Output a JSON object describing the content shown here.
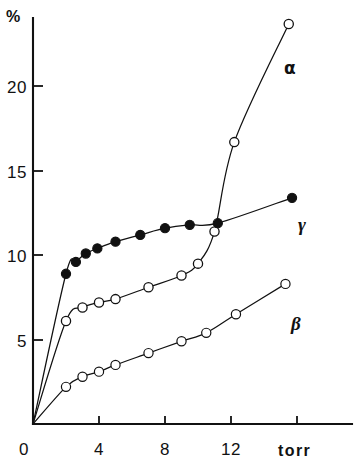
{
  "chart_data": {
    "type": "scatter",
    "title": "",
    "subtitle": "",
    "xlabel": "torr",
    "ylabel": "%",
    "xlim": [
      0,
      17.5
    ],
    "ylim": [
      0,
      25.5
    ],
    "xticks": [
      0,
      4,
      8,
      12,
      16
    ],
    "xtick_labels": [
      "0",
      "4",
      "8",
      "12",
      ""
    ],
    "yticks": [
      0,
      5,
      10,
      15,
      20
    ],
    "ytick_labels": [
      "0",
      "5",
      "10",
      "15",
      "20"
    ],
    "grid": false,
    "legend_position": "inline-annotations",
    "annotations": [
      {
        "text": "α",
        "x": 13.2,
        "y": 21.0,
        "series": "alpha"
      },
      {
        "text": "γ",
        "x": 16.2,
        "y": 11.8,
        "series": "gamma"
      },
      {
        "text": "β",
        "x": 15.7,
        "y": 6.0,
        "series": "beta"
      }
    ],
    "series": [
      {
        "name": "α",
        "label": "alpha",
        "marker": "open-circle",
        "points": [
          {
            "x": 0.0,
            "y": 0.0
          },
          {
            "x": 2.0,
            "y": 6.1
          },
          {
            "x": 3.0,
            "y": 6.9
          },
          {
            "x": 4.0,
            "y": 7.2
          },
          {
            "x": 5.0,
            "y": 7.4
          },
          {
            "x": 7.0,
            "y": 8.1
          },
          {
            "x": 9.0,
            "y": 8.8
          },
          {
            "x": 10.0,
            "y": 9.5
          },
          {
            "x": 11.0,
            "y": 11.4
          },
          {
            "x": 12.2,
            "y": 16.7
          },
          {
            "x": 15.5,
            "y": 23.7
          }
        ]
      },
      {
        "name": "γ",
        "label": "gamma",
        "marker": "filled-circle",
        "points": [
          {
            "x": 0.0,
            "y": 0.0
          },
          {
            "x": 2.0,
            "y": 8.9
          },
          {
            "x": 2.6,
            "y": 9.6
          },
          {
            "x": 3.2,
            "y": 10.1
          },
          {
            "x": 3.9,
            "y": 10.4
          },
          {
            "x": 5.0,
            "y": 10.8
          },
          {
            "x": 6.5,
            "y": 11.2
          },
          {
            "x": 8.0,
            "y": 11.6
          },
          {
            "x": 9.5,
            "y": 11.8
          },
          {
            "x": 11.2,
            "y": 11.9
          },
          {
            "x": 15.7,
            "y": 13.4
          }
        ]
      },
      {
        "name": "β",
        "label": "beta",
        "marker": "half-filled-circle",
        "points": [
          {
            "x": 0.0,
            "y": 0.0
          },
          {
            "x": 2.0,
            "y": 2.2
          },
          {
            "x": 3.0,
            "y": 2.8
          },
          {
            "x": 4.0,
            "y": 3.1
          },
          {
            "x": 5.0,
            "y": 3.5
          },
          {
            "x": 7.0,
            "y": 4.2
          },
          {
            "x": 9.0,
            "y": 4.9
          },
          {
            "x": 10.5,
            "y": 5.4
          },
          {
            "x": 12.3,
            "y": 6.5
          },
          {
            "x": 15.3,
            "y": 8.3
          }
        ]
      }
    ],
    "colors": {
      "axis": "#111111",
      "curve": "#111111",
      "marker_fill_open": "#ffffff",
      "marker_fill_solid": "#111111",
      "background": "#ffffff"
    }
  },
  "axes": {
    "y_unit_label": "%",
    "x_unit_label": "torr",
    "y_tick_20": "20",
    "y_tick_15": "15",
    "y_tick_10": "10",
    "y_tick_5": "5",
    "origin_label": "0",
    "x_tick_4": "4",
    "x_tick_8": "8",
    "x_tick_12": "12"
  },
  "labels": {
    "alpha": "α",
    "gamma": "γ",
    "beta": "β"
  }
}
